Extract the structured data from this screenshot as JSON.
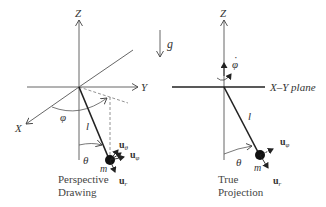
{
  "diagram": {
    "left_panel": {
      "caption_line1": "Perspective",
      "caption_line2": "Drawing",
      "axes": {
        "z": "Z",
        "y": "Y",
        "x": "X"
      },
      "angle_phi": "φ",
      "angle_theta": "θ",
      "length": "l",
      "mass": "m",
      "unit_theta": "u",
      "unit_theta_sub": "θ",
      "unit_phi": "u",
      "unit_phi_sub": "φ",
      "unit_r": "u",
      "unit_r_sub": "r"
    },
    "gravity": {
      "label": "g"
    },
    "right_panel": {
      "caption_line1": "True",
      "caption_line2": "Projection",
      "axes": {
        "z": "Z"
      },
      "plane_label": "X–Y plane",
      "phi_dot": "φ",
      "phi_dot_mark": "·",
      "angle_theta": "θ",
      "length": "l",
      "mass": "m",
      "unit_phi": "u",
      "unit_phi_sub": "φ",
      "unit_r": "u",
      "unit_r_sub": "r"
    },
    "colors": {
      "ink": "#333333",
      "thin": "#555555",
      "dashed": "#777777"
    }
  }
}
